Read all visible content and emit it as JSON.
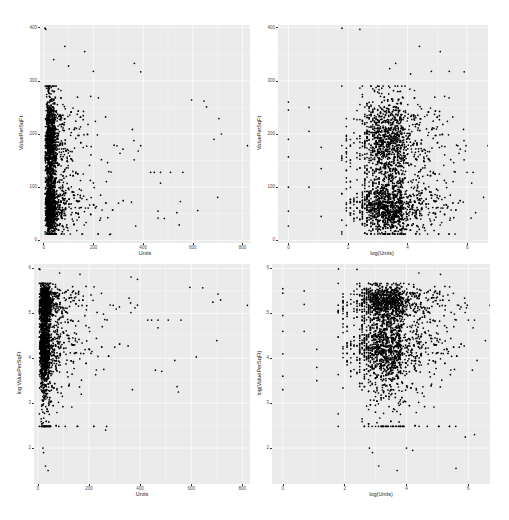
{
  "chart_data": [
    {
      "type": "scatter",
      "title": "",
      "xlabel": "Units",
      "ylabel": "ValuePerSqFt",
      "xlim": [
        -15,
        830
      ],
      "ylim": [
        -5,
        405
      ],
      "xticks": [
        0,
        200,
        400,
        600,
        800
      ],
      "yticks": [
        0,
        100,
        200,
        300,
        400
      ],
      "grid": true,
      "point_summary": {
        "dense_region": {
          "x": [
            0,
            150
          ],
          "y": [
            20,
            300
          ]
        },
        "outliers": [
          [
            5,
            399
          ],
          [
            8,
            397
          ],
          [
            85,
            365
          ],
          [
            165,
            355
          ],
          [
            365,
            333
          ],
          [
            390,
            317
          ],
          [
            40,
            340
          ],
          [
            100,
            328
          ],
          [
            200,
            318
          ],
          [
            820,
            178
          ],
          [
            715,
            200
          ],
          [
            705,
            229
          ],
          [
            645,
            262
          ],
          [
            655,
            251
          ],
          [
            595,
            264
          ],
          [
            685,
            190
          ],
          [
            620,
            56
          ],
          [
            545,
            29
          ],
          [
            550,
            73
          ],
          [
            485,
            41
          ],
          [
            370,
            27
          ],
          [
            265,
            11
          ],
          [
            460,
            55
          ],
          [
            430,
            128
          ],
          [
            445,
            128
          ],
          [
            470,
            128
          ],
          [
            510,
            128
          ],
          [
            560,
            128
          ]
        ]
      }
    },
    {
      "type": "scatter",
      "title": "",
      "xlabel": "log(Units)",
      "ylabel": "ValuePerSqFt",
      "xlim": [
        -0.35,
        6.7
      ],
      "ylim": [
        -5,
        405
      ],
      "xticks": [
        0,
        2,
        4,
        6
      ],
      "yticks": [
        0,
        100,
        200,
        300,
        400
      ],
      "grid": true,
      "point_summary": {
        "dense_region": {
          "x": [
            2.0,
            6.5
          ],
          "y": [
            20,
            280
          ]
        },
        "outliers": [
          [
            1.8,
            399
          ],
          [
            2.4,
            397
          ],
          [
            4.4,
            365
          ],
          [
            5.1,
            355
          ],
          [
            3.6,
            333
          ],
          [
            5.9,
            317
          ],
          [
            3.4,
            323
          ],
          [
            4.1,
            313
          ],
          [
            4.8,
            318
          ],
          [
            5.4,
            318
          ],
          [
            6.7,
            178
          ],
          [
            6.0,
            128
          ],
          [
            6.2,
            128
          ],
          [
            0,
            260
          ],
          [
            0,
            245
          ],
          [
            0,
            190
          ],
          [
            0,
            157
          ],
          [
            0,
            100
          ],
          [
            0,
            55
          ],
          [
            0,
            27
          ],
          [
            0.69,
            250
          ],
          [
            0.69,
            205
          ],
          [
            0.69,
            100
          ],
          [
            1.1,
            175
          ],
          [
            1.1,
            135
          ],
          [
            1.1,
            45
          ]
        ]
      }
    },
    {
      "type": "scatter",
      "title": "",
      "xlabel": "Units",
      "ylabel": "log ValuePerSqFt",
      "xlim": [
        -15,
        830
      ],
      "ylim": [
        1.2,
        6.1
      ],
      "xticks": [
        0,
        200,
        400,
        600,
        800
      ],
      "yticks": [
        2,
        3,
        4,
        5,
        6
      ],
      "grid": true,
      "point_summary": {
        "dense_region": {
          "x": [
            0,
            150
          ],
          "y": [
            3.5,
            5.7
          ]
        },
        "outliers": [
          [
            5,
            5.99
          ],
          [
            8,
            5.98
          ],
          [
            85,
            5.9
          ],
          [
            165,
            5.87
          ],
          [
            365,
            5.81
          ],
          [
            390,
            5.76
          ],
          [
            820,
            5.18
          ],
          [
            715,
            5.3
          ],
          [
            705,
            5.43
          ],
          [
            645,
            5.57
          ],
          [
            595,
            5.58
          ],
          [
            685,
            5.25
          ],
          [
            620,
            4.03
          ],
          [
            545,
            3.37
          ],
          [
            550,
            3.25
          ],
          [
            485,
            3.71
          ],
          [
            370,
            3.3
          ],
          [
            265,
            2.4
          ],
          [
            20,
            2.0
          ],
          [
            22,
            1.9
          ],
          [
            30,
            1.6
          ],
          [
            40,
            1.5
          ],
          [
            170,
            3.2
          ],
          [
            430,
            4.85
          ],
          [
            445,
            4.85
          ],
          [
            470,
            4.85
          ],
          [
            510,
            4.85
          ],
          [
            560,
            4.85
          ]
        ]
      }
    },
    {
      "type": "scatter",
      "title": "",
      "xlabel": "log(Units)",
      "ylabel": "log(ValuePerSqFt)",
      "xlim": [
        -0.35,
        6.7
      ],
      "ylim": [
        1.2,
        6.1
      ],
      "xticks": [
        0,
        2,
        4,
        6
      ],
      "yticks": [
        2,
        3,
        4,
        5,
        6
      ],
      "grid": true,
      "point_summary": {
        "dense_region": {
          "x": [
            2.0,
            6.5
          ],
          "y": [
            3.5,
            5.7
          ]
        },
        "outliers": [
          [
            1.8,
            5.99
          ],
          [
            2.4,
            5.98
          ],
          [
            4.4,
            5.9
          ],
          [
            5.1,
            5.87
          ],
          [
            6.7,
            5.18
          ],
          [
            6.0,
            4.85
          ],
          [
            6.2,
            4.85
          ],
          [
            2.8,
            2.0
          ],
          [
            2.9,
            1.9
          ],
          [
            3.1,
            1.6
          ],
          [
            3.7,
            1.5
          ],
          [
            4.0,
            2.0
          ],
          [
            4.2,
            1.95
          ],
          [
            5.6,
            1.55
          ],
          [
            5.9,
            2.25
          ],
          [
            6.2,
            2.3
          ],
          [
            0,
            5.55
          ],
          [
            0,
            5.45
          ],
          [
            0,
            4.95
          ],
          [
            0,
            4.6
          ],
          [
            0,
            4.1
          ],
          [
            0,
            3.6
          ],
          [
            0,
            3.3
          ],
          [
            0.69,
            5.5
          ],
          [
            0.69,
            5.2
          ],
          [
            0.69,
            4.6
          ],
          [
            1.1,
            4.2
          ],
          [
            1.1,
            3.8
          ],
          [
            1.1,
            3.5
          ]
        ]
      }
    }
  ],
  "panels": [
    {
      "xlabel": "Units",
      "ylabel": "ValuePerSqFt",
      "xticks": [
        "0",
        "200",
        "400",
        "600",
        "800"
      ],
      "yticks": [
        "0",
        "100",
        "200",
        "300",
        "400"
      ]
    },
    {
      "xlabel": "log(Units)",
      "ylabel": "ValuePerSqFt",
      "xticks": [
        "0",
        "2",
        "4",
        "6"
      ],
      "yticks": [
        "0",
        "100",
        "200",
        "300",
        "400"
      ]
    },
    {
      "xlabel": "Units",
      "ylabel": "log ValuePerSqFt",
      "xticks": [
        "0",
        "200",
        "400",
        "600",
        "800"
      ],
      "yticks": [
        "2",
        "3",
        "4",
        "5",
        "6"
      ]
    },
    {
      "xlabel": "log(Units)",
      "ylabel": "log(ValuePerSqFt)",
      "xticks": [
        "0",
        "2",
        "4",
        "6"
      ],
      "yticks": [
        "2",
        "3",
        "4",
        "5",
        "6"
      ]
    }
  ],
  "colors": {
    "panel_bg": "#ebebeb",
    "grid": "#ffffff",
    "point": "#000000",
    "tick_text": "#4d4d4d"
  }
}
